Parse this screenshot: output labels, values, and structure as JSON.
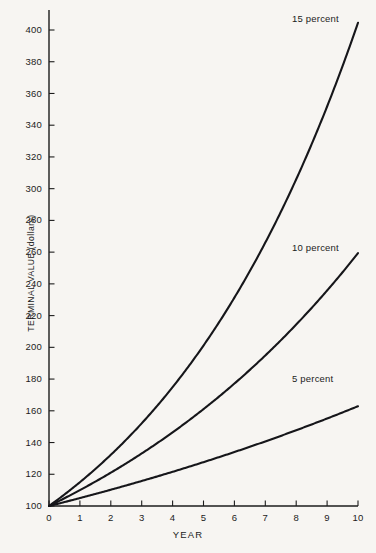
{
  "chart_data": {
    "type": "line",
    "title": "",
    "xlabel": "YEAR",
    "ylabel": "TERMINAL VALUE (dollars)",
    "xlim": [
      0,
      10
    ],
    "ylim": [
      100,
      410
    ],
    "grid": false,
    "legend_position": "inline-right-of-curve-ends",
    "x": [
      0,
      1,
      2,
      3,
      4,
      5,
      6,
      7,
      8,
      9,
      10
    ],
    "xticks": [
      "0",
      "1",
      "2",
      "3",
      "4",
      "5",
      "6",
      "7",
      "8",
      "9",
      "10"
    ],
    "yticks": [
      "100",
      "120",
      "140",
      "160",
      "180",
      "200",
      "220",
      "240",
      "260",
      "280",
      "300",
      "320",
      "340",
      "360",
      "380",
      "400"
    ],
    "series": [
      {
        "name": "5 percent",
        "label": "5 percent",
        "rate": 0.05,
        "values": [
          100,
          105,
          110.3,
          115.8,
          121.6,
          127.6,
          134,
          140.7,
          147.7,
          155.1,
          162.9
        ]
      },
      {
        "name": "10 percent",
        "label": "10 percent",
        "rate": 0.1,
        "values": [
          100,
          110,
          121,
          133.1,
          146.4,
          161.1,
          177.2,
          194.9,
          214.4,
          235.8,
          259.4
        ]
      },
      {
        "name": "15 percent",
        "label": "15 percent",
        "rate": 0.15,
        "values": [
          100,
          115,
          132.3,
          152.1,
          174.9,
          201.1,
          231.3,
          266,
          305.9,
          351.8,
          404.6
        ]
      }
    ],
    "annotations": [
      {
        "text": "15 percent",
        "x_px": 292,
        "y_px": 14
      },
      {
        "text": "10 percent",
        "x_px": 292,
        "y_px": 243
      },
      {
        "text": "5 percent",
        "x_px": 292,
        "y_px": 374
      }
    ],
    "colors": {
      "background": "#f7f5f2",
      "axis": "#1c1c1c",
      "curve": "#16161a"
    }
  }
}
